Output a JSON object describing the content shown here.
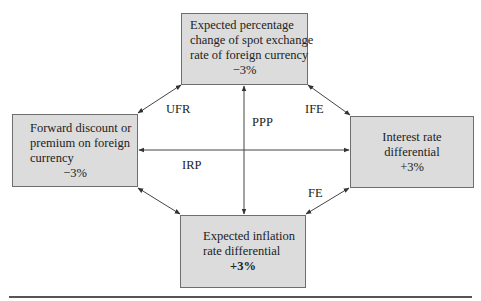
{
  "diagram": {
    "boxes": {
      "top": {
        "lines": [
          "Expected percentage",
          "change of spot exchange",
          "rate of foreign currency"
        ],
        "value": "−3%"
      },
      "left": {
        "lines": [
          "Forward discount or",
          "premium on foreign",
          "currency"
        ],
        "value": "−3%"
      },
      "right": {
        "lines": [
          "Interest rate",
          "differential"
        ],
        "value": "+3%"
      },
      "bottom": {
        "lines": [
          "Expected inflation",
          "rate differential"
        ],
        "value": "+3%"
      }
    },
    "relations": {
      "ufr": "UFR",
      "ife": "IFE",
      "ppp": "PPP",
      "irp": "IRP",
      "fe": "FE"
    },
    "colors": {
      "box_fill": "#dcdcdc",
      "box_border": "#6e6e6e",
      "arrow": "#444444"
    }
  }
}
